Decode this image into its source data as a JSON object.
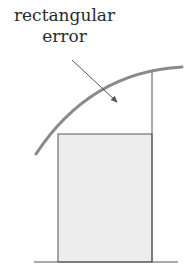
{
  "diagram": {
    "label": {
      "line1": "rectangular",
      "line2": "error"
    },
    "colors": {
      "curve": "#8a8a8a",
      "rect_fill": "#ededed",
      "rect_stroke": "#555555",
      "baseline": "#555555",
      "arrow": "#555555",
      "text": "#2a2a2a"
    },
    "elements": [
      "curve f(x)",
      "shaded rectangle",
      "vertical line at right edge",
      "baseline axis",
      "arrow pointing to error region"
    ]
  }
}
